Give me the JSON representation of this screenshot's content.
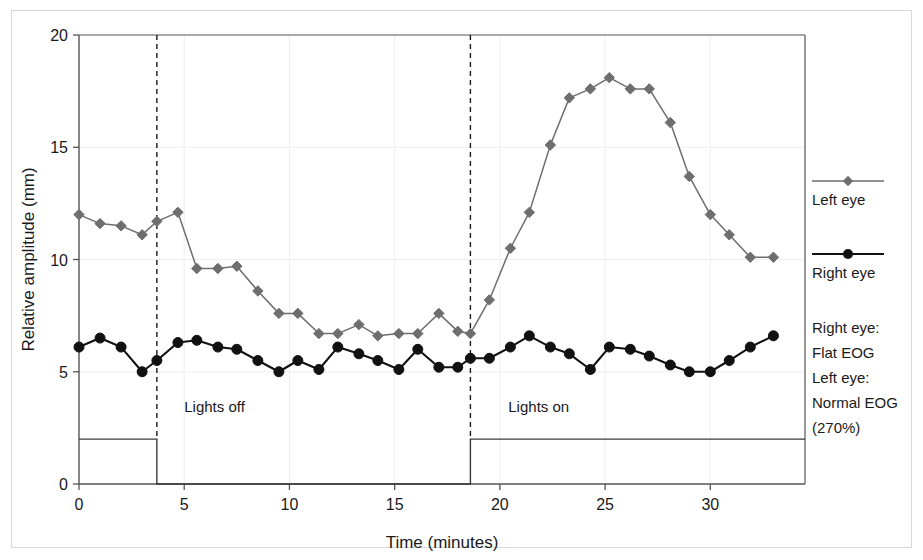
{
  "chart_data": {
    "type": "line",
    "title": "",
    "xlabel": "Time (minutes)",
    "ylabel": "Relative amplitude (mm)",
    "xlim": [
      0,
      34.5
    ],
    "ylim": [
      0,
      20
    ],
    "xticks": [
      0,
      5,
      10,
      15,
      20,
      25,
      30
    ],
    "yticks": [
      0,
      5,
      10,
      15,
      20
    ],
    "grid": true,
    "legend_position": "right",
    "series": [
      {
        "name": "Left eye",
        "color": "#6e6e6e",
        "marker": "diamond",
        "x": [
          0.0,
          1.0,
          2.0,
          3.0,
          3.7,
          4.7,
          5.6,
          6.6,
          7.5,
          8.5,
          9.5,
          10.4,
          11.4,
          12.3,
          13.3,
          14.2,
          15.2,
          16.1,
          17.1,
          18.0,
          18.6,
          19.5,
          20.5,
          21.4,
          22.4,
          23.3,
          24.3,
          25.2,
          26.2,
          27.1,
          28.1,
          29.0,
          30.0,
          30.9,
          31.9,
          33.0
        ],
        "values": [
          12.0,
          11.6,
          11.5,
          11.1,
          11.7,
          12.1,
          9.6,
          9.6,
          9.7,
          8.6,
          7.6,
          7.6,
          6.7,
          6.7,
          7.1,
          6.6,
          6.7,
          6.7,
          7.6,
          6.8,
          6.7,
          8.2,
          10.5,
          12.1,
          15.1,
          17.2,
          17.6,
          18.1,
          17.6,
          17.6,
          16.1,
          13.7,
          12.0,
          11.1,
          10.1,
          10.1
        ]
      },
      {
        "name": "Right eye",
        "color": "#111111",
        "marker": "circle",
        "x": [
          0.0,
          1.0,
          2.0,
          3.0,
          3.7,
          4.7,
          5.6,
          6.6,
          7.5,
          8.5,
          9.5,
          10.4,
          11.4,
          12.3,
          13.3,
          14.2,
          15.2,
          16.1,
          17.1,
          18.0,
          18.6,
          19.5,
          20.5,
          21.4,
          22.4,
          23.3,
          24.3,
          25.2,
          26.2,
          27.1,
          28.1,
          29.0,
          30.0,
          30.9,
          31.9,
          33.0
        ],
        "values": [
          6.1,
          6.5,
          6.1,
          5.0,
          5.5,
          6.3,
          6.4,
          6.1,
          6.0,
          5.5,
          5.0,
          5.5,
          5.1,
          6.1,
          5.8,
          5.5,
          5.1,
          6.0,
          5.2,
          5.2,
          5.6,
          5.6,
          6.1,
          6.6,
          6.1,
          5.8,
          5.1,
          6.1,
          6.0,
          5.7,
          5.3,
          5.0,
          5.0,
          5.5,
          6.1,
          6.6
        ]
      }
    ],
    "annotations": [
      {
        "text": "Lights off",
        "x": 5.0,
        "y": 3.2
      },
      {
        "text": "Lights on",
        "x": 20.4,
        "y": 3.2
      }
    ],
    "event_markers": [
      {
        "label": "lights-off-start",
        "x": 3.7
      },
      {
        "label": "lights-on-start",
        "x": 18.6
      }
    ],
    "stimulus_trace": {
      "description": "square-wave light stimulus trace",
      "high_level": 2.0,
      "low_level": 0.0,
      "segments": [
        {
          "x_start": 0.0,
          "x_end": 3.7,
          "level": "high"
        },
        {
          "x_start": 3.7,
          "x_end": 18.6,
          "level": "low"
        },
        {
          "x_start": 18.6,
          "x_end": 34.5,
          "level": "high"
        }
      ]
    }
  },
  "legend": {
    "entries": [
      {
        "label": "Left eye",
        "color": "#6e6e6e",
        "marker": "diamond"
      },
      {
        "label": "Right eye",
        "color": "#111111",
        "marker": "circle"
      }
    ]
  },
  "notes": {
    "lines": [
      "Right eye:",
      "Flat EOG",
      "Left eye:",
      "Normal EOG",
      "(270%)"
    ]
  }
}
